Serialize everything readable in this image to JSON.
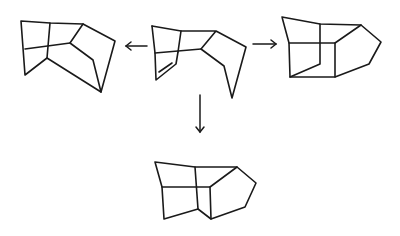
{
  "diagram": {
    "type": "chemical-reaction-scheme",
    "colors": {
      "ink": "#1a1a1a",
      "background": "#ffffff"
    },
    "structures": [
      {
        "id": "center",
        "role": "reactant",
        "has_double_bond": true
      },
      {
        "id": "left",
        "role": "product"
      },
      {
        "id": "right",
        "role": "product"
      },
      {
        "id": "bottom",
        "role": "product"
      }
    ],
    "arrows": [
      {
        "from": "center",
        "to": "left",
        "direction": "left"
      },
      {
        "from": "center",
        "to": "right",
        "direction": "right"
      },
      {
        "from": "center",
        "to": "bottom",
        "direction": "down"
      }
    ]
  }
}
